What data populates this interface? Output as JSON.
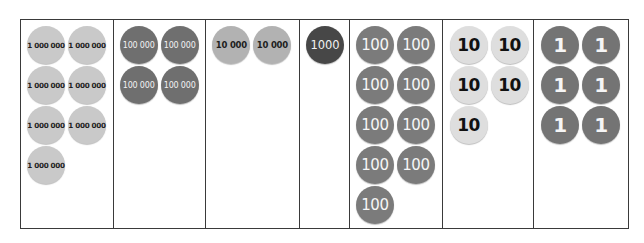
{
  "place_value_chart": {
    "columns": [
      {
        "name": "millions",
        "coin_label": "1 000 000",
        "count": 7,
        "color": "#c9c9c9"
      },
      {
        "name": "hundred-thousands",
        "coin_label": "100 000",
        "count": 4,
        "color": "#6f6f6f"
      },
      {
        "name": "ten-thousands",
        "coin_label": "10 000",
        "count": 2,
        "color": "#b2b2b2"
      },
      {
        "name": "thousands",
        "coin_label": "1000",
        "count": 1,
        "color": "#474747"
      },
      {
        "name": "hundreds",
        "coin_label": "100",
        "count": 9,
        "color": "#7b7b7b"
      },
      {
        "name": "tens",
        "coin_label": "10",
        "count": 5,
        "color": "#dedede"
      },
      {
        "name": "ones",
        "coin_label": "1",
        "count": 6,
        "color": "#747474"
      }
    ]
  }
}
